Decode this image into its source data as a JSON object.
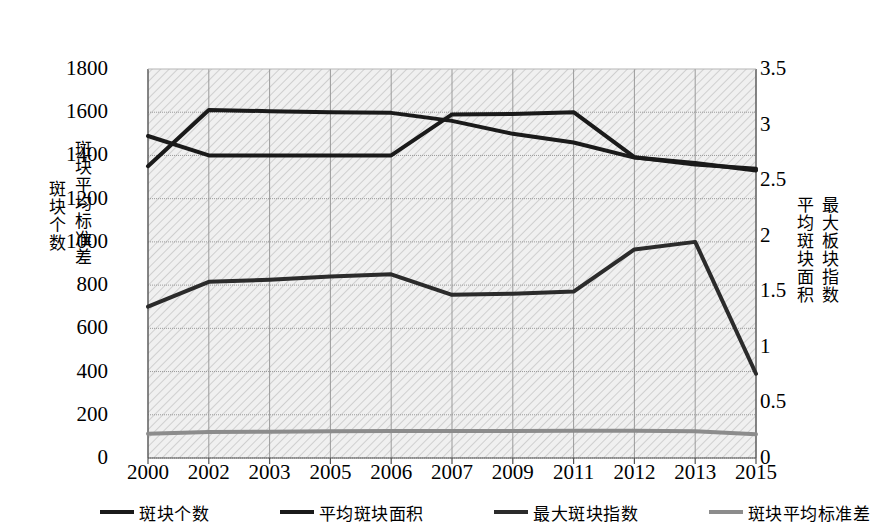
{
  "chart_data": {
    "type": "line",
    "title": "",
    "xlabel": "",
    "grid": true,
    "legend_position": "bottom",
    "categories": [
      "2000",
      "2002",
      "2003",
      "2005",
      "2006",
      "2007",
      "2009",
      "2011",
      "2012",
      "2013",
      "2015"
    ],
    "axes": {
      "left": {
        "title_outer": "斑块个数",
        "title_inner": "斑块平均标准差",
        "min": 0,
        "max": 1800,
        "ticks": [
          0,
          200,
          400,
          600,
          800,
          1000,
          1200,
          1400,
          1600,
          1800
        ],
        "tick_labels": [
          "0",
          "200",
          "400",
          "600",
          "800",
          "1000",
          "1200",
          "1400",
          "1600",
          "1800"
        ]
      },
      "right": {
        "title_inner": "平均斑块面积",
        "title_outer": "最大板块指数",
        "min": 0,
        "max": 3.5,
        "ticks": [
          0,
          0.5,
          1,
          1.5,
          2,
          2.5,
          3,
          3.5
        ],
        "tick_labels": [
          "0",
          "0.5",
          "1",
          "1.5",
          "2",
          "2.5",
          "3",
          "3.5"
        ]
      }
    },
    "series": [
      {
        "name": "斑块个数",
        "axis": "left",
        "color": "#1a1a1a",
        "width": 4,
        "values": [
          1350,
          1610,
          1605,
          1600,
          1597,
          1560,
          1500,
          1460,
          1390,
          1365,
          1330
        ]
      },
      {
        "name": "平均斑块面积",
        "axis": "left",
        "color": "#1a1a1a",
        "width": 4,
        "values": [
          1490,
          1400,
          1400,
          1400,
          1400,
          1590,
          1592,
          1600,
          1392,
          1358,
          1338
        ]
      },
      {
        "name": "最大斑块指数",
        "axis": "left",
        "color": "#2b2b2b",
        "width": 4,
        "values": [
          700,
          815,
          825,
          840,
          850,
          755,
          760,
          770,
          965,
          1000,
          390
        ]
      },
      {
        "name": "斑块平均标准差",
        "axis": "left",
        "color": "#8c8c8c",
        "width": 4,
        "values": [
          112,
          120,
          122,
          124,
          125,
          125,
          125,
          126,
          126,
          124,
          110
        ]
      }
    ],
    "legend": [
      {
        "label": "斑块个数",
        "color": "#1a1a1a"
      },
      {
        "label": "平均斑块面积",
        "color": "#1a1a1a"
      },
      {
        "label": "最大斑块指数",
        "color": "#2b2b2b"
      },
      {
        "label": "斑块平均标准差",
        "color": "#8c8c8c"
      }
    ]
  }
}
